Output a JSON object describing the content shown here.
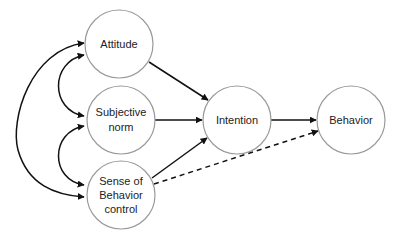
{
  "diagram": {
    "nodes": [
      {
        "id": "attitude",
        "lines": [
          "Attitude"
        ],
        "cx": 119,
        "cy": 44,
        "r": 34
      },
      {
        "id": "subjective_norm",
        "lines": [
          "Subjective",
          "norm"
        ],
        "cx": 121,
        "cy": 120,
        "r": 34
      },
      {
        "id": "sense_of_behavior_control",
        "lines": [
          "Sense of",
          "Behavior",
          "control"
        ],
        "cx": 121,
        "cy": 195,
        "r": 34
      },
      {
        "id": "intention",
        "lines": [
          "Intention"
        ],
        "cx": 237,
        "cy": 120,
        "r": 34
      },
      {
        "id": "behavior",
        "lines": [
          "Behavior"
        ],
        "cx": 351,
        "cy": 120,
        "r": 34
      }
    ],
    "edges": [
      {
        "from": "attitude",
        "to": "intention",
        "style": "solid",
        "type": "directed"
      },
      {
        "from": "subjective_norm",
        "to": "intention",
        "style": "solid",
        "type": "directed"
      },
      {
        "from": "sense_of_behavior_control",
        "to": "intention",
        "style": "solid",
        "type": "directed"
      },
      {
        "from": "intention",
        "to": "behavior",
        "style": "solid",
        "type": "directed"
      },
      {
        "from": "sense_of_behavior_control",
        "to": "behavior",
        "style": "dashed",
        "type": "directed"
      },
      {
        "from": "attitude",
        "to": "subjective_norm",
        "style": "solid",
        "type": "bidirectional-curve"
      },
      {
        "from": "subjective_norm",
        "to": "sense_of_behavior_control",
        "style": "solid",
        "type": "bidirectional-curve"
      },
      {
        "from": "attitude",
        "to": "sense_of_behavior_control",
        "style": "solid",
        "type": "bidirectional-curve"
      }
    ],
    "labels": {
      "attitude_l1": "Attitude",
      "subjective_norm_l1": "Subjective",
      "subjective_norm_l2": "norm",
      "sense_l1": "Sense of",
      "sense_l2": "Behavior",
      "sense_l3": "control",
      "intention_l1": "Intention",
      "behavior_l1": "Behavior"
    }
  }
}
